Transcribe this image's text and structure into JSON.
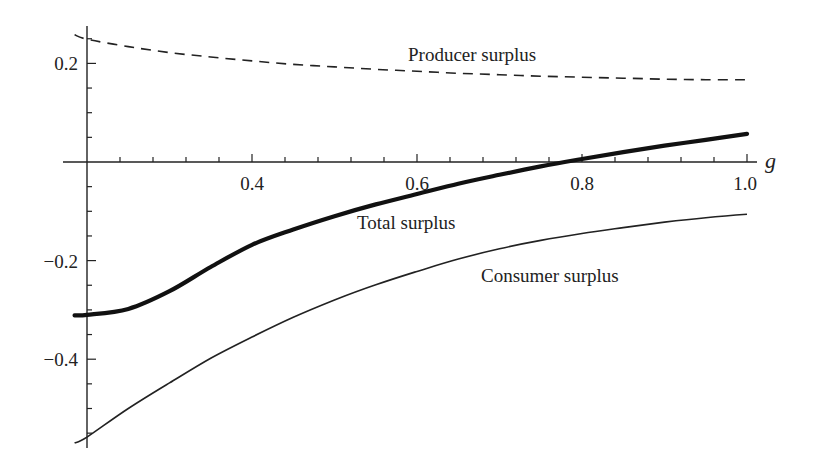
{
  "chart_data": {
    "type": "line",
    "title": "",
    "xlabel": "g",
    "ylabel": "",
    "xlim": [
      0.2,
      1.0
    ],
    "ylim": [
      -0.57,
      0.27
    ],
    "grid": false,
    "legend": "inline labels",
    "x_ticks": [
      {
        "value": 0.4,
        "label": "0.4"
      },
      {
        "value": 0.6,
        "label": "0.6"
      },
      {
        "value": 0.8,
        "label": "0.8"
      },
      {
        "value": 1.0,
        "label": "1.0"
      }
    ],
    "y_ticks": [
      {
        "value": 0.2,
        "label": "0.2"
      },
      {
        "value": -0.2,
        "label": "−0.2"
      },
      {
        "value": -0.4,
        "label": "−0.4"
      }
    ],
    "x": [
      0.185,
      0.2,
      0.25,
      0.3,
      0.35,
      0.4,
      0.45,
      0.5,
      0.55,
      0.6,
      0.65,
      0.7,
      0.75,
      0.8,
      0.85,
      0.9,
      0.95,
      1.0
    ],
    "series": [
      {
        "name": "Producer surplus",
        "style": "dashed",
        "values": [
          0.258,
          0.249,
          0.234,
          0.222,
          0.213,
          0.205,
          0.198,
          0.193,
          0.188,
          0.184,
          0.18,
          0.177,
          0.174,
          0.172,
          0.17,
          0.168,
          0.167,
          0.167
        ]
      },
      {
        "name": "Total surplus",
        "style": "thick",
        "values": [
          -0.311,
          -0.31,
          -0.298,
          -0.262,
          -0.213,
          -0.168,
          -0.137,
          -0.11,
          -0.086,
          -0.065,
          -0.044,
          -0.026,
          -0.009,
          0.006,
          0.02,
          0.033,
          0.045,
          0.057
        ]
      },
      {
        "name": "Consumer surplus",
        "style": "thin",
        "values": [
          -0.57,
          -0.558,
          -0.5,
          -0.448,
          -0.398,
          -0.355,
          -0.315,
          -0.28,
          -0.249,
          -0.222,
          -0.197,
          -0.176,
          -0.159,
          -0.145,
          -0.133,
          -0.122,
          -0.113,
          -0.106
        ]
      }
    ],
    "annotations": [
      {
        "text": "Producer surplus",
        "series": "Producer surplus"
      },
      {
        "text": "Total surplus",
        "series": "Total surplus"
      },
      {
        "text": "Consumer surplus",
        "series": "Consumer surplus"
      }
    ]
  },
  "labels": {
    "producer": "Producer surplus",
    "total": "Total surplus",
    "consumer": "Consumer surplus",
    "x_var": "g",
    "x_tick_0": "0.4",
    "x_tick_1": "0.6",
    "x_tick_2": "0.8",
    "x_tick_3": "1.0",
    "y_tick_0": "0.2",
    "y_tick_1": "−0.2",
    "y_tick_2": "−0.4"
  }
}
